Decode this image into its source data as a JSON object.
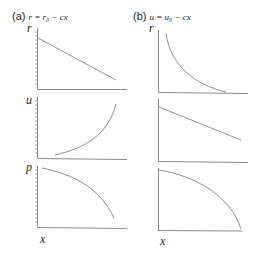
{
  "panels": {
    "a": {
      "tag": "(a)",
      "equation": "r = r₀ − cx",
      "plots": [
        {
          "ylabel": "r",
          "curve": "linear-decreasing"
        },
        {
          "ylabel": "u",
          "curve": "convex-increasing"
        },
        {
          "ylabel": "p",
          "curve": "concave-decreasing"
        }
      ],
      "xlabel": "x"
    },
    "b": {
      "tag": "(b)",
      "equation": "u = u₀ − cx",
      "plots": [
        {
          "ylabel": "r",
          "curve": "hyperbolic-decreasing"
        },
        {
          "ylabel": "u",
          "curve": "linear-decreasing"
        },
        {
          "ylabel": "p",
          "curve": "concave-decreasing"
        }
      ],
      "xlabel": "x"
    }
  },
  "colors": {
    "axis": "#8a8a8a",
    "curve": "#8f8f8f",
    "text": "#222222"
  }
}
